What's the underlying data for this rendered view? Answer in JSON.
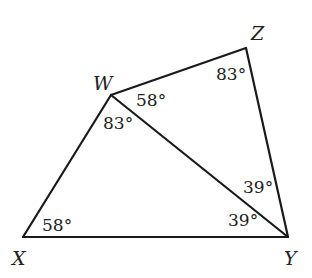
{
  "diagram": {
    "type": "geometry-figure",
    "stroke_color": "#1a1a1a",
    "vertices": [
      {
        "id": "W",
        "label": "W",
        "x": 111,
        "y": 95
      },
      {
        "id": "Z",
        "label": "Z",
        "x": 246,
        "y": 48
      },
      {
        "id": "X",
        "label": "X",
        "x": 23,
        "y": 237
      },
      {
        "id": "Y",
        "label": "Y",
        "x": 288,
        "y": 237
      }
    ],
    "segments": [
      [
        "X",
        "W"
      ],
      [
        "W",
        "Z"
      ],
      [
        "Z",
        "Y"
      ],
      [
        "X",
        "Y"
      ],
      [
        "W",
        "Y"
      ]
    ],
    "angles": [
      {
        "at": "W",
        "between": "Z-W-Y",
        "label": "58°"
      },
      {
        "at": "W",
        "between": "X-W-Y",
        "label": "83°"
      },
      {
        "at": "Z",
        "between": "W-Z-Y",
        "label": "83°"
      },
      {
        "at": "X",
        "between": "W-X-Y",
        "label": "58°"
      },
      {
        "at": "Y",
        "between": "W-Y-Z",
        "label": "39°"
      },
      {
        "at": "Y",
        "between": "X-Y-W",
        "label": "39°"
      }
    ]
  }
}
